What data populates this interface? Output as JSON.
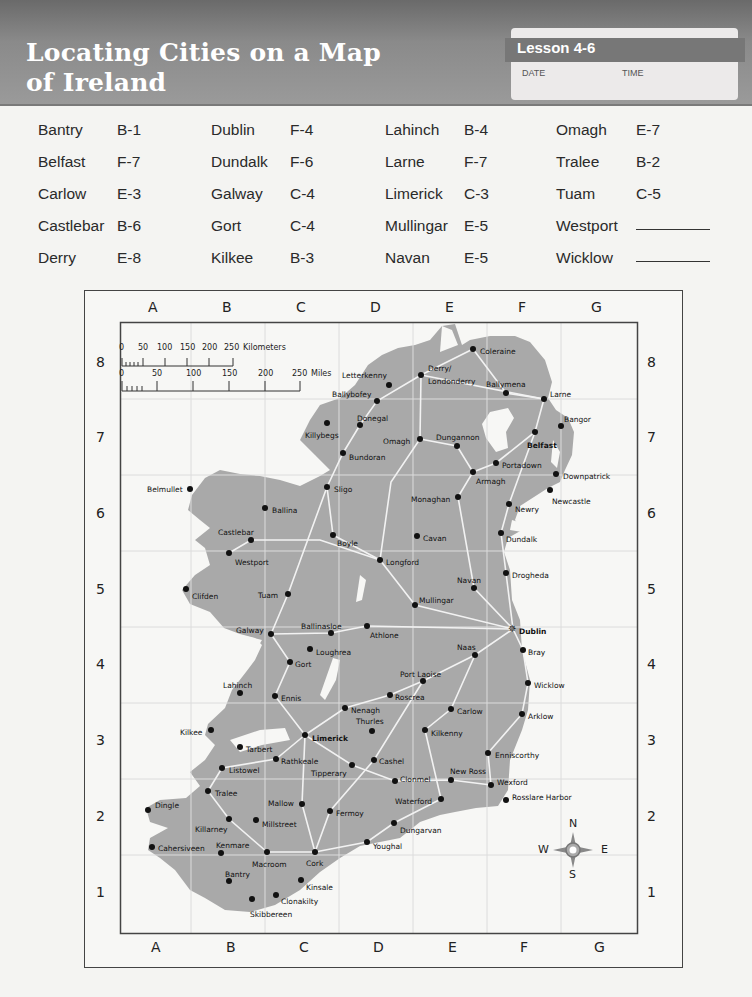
{
  "header": {
    "title_line1": "Locating Cities on a Map",
    "title_line2": "of Ireland",
    "lesson": "Lesson 4-6",
    "date_label": "DATE",
    "time_label": "TIME"
  },
  "city_list": [
    {
      "city": "Bantry",
      "grid": "B-1"
    },
    {
      "city": "Belfast",
      "grid": "F-7"
    },
    {
      "city": "Carlow",
      "grid": "E-3"
    },
    {
      "city": "Castlebar",
      "grid": "B-6"
    },
    {
      "city": "Derry",
      "grid": "E-8"
    },
    {
      "city": "Dublin",
      "grid": "F-4"
    },
    {
      "city": "Dundalk",
      "grid": "F-6"
    },
    {
      "city": "Galway",
      "grid": "C-4"
    },
    {
      "city": "Gort",
      "grid": "C-4"
    },
    {
      "city": "Kilkee",
      "grid": "B-3"
    },
    {
      "city": "Lahinch",
      "grid": "B-4"
    },
    {
      "city": "Larne",
      "grid": "F-7"
    },
    {
      "city": "Limerick",
      "grid": "C-3"
    },
    {
      "city": "Mullingar",
      "grid": "E-5"
    },
    {
      "city": "Navan",
      "grid": "E-5"
    },
    {
      "city": "Omagh",
      "grid": "E-7"
    },
    {
      "city": "Tralee",
      "grid": "B-2"
    },
    {
      "city": "Tuam",
      "grid": "C-5"
    },
    {
      "city": "Westport",
      "grid": ""
    },
    {
      "city": "Wicklow",
      "grid": ""
    }
  ],
  "map": {
    "columns": [
      "A",
      "B",
      "C",
      "D",
      "E",
      "F",
      "G"
    ],
    "rows": [
      "8",
      "7",
      "6",
      "5",
      "4",
      "3",
      "2",
      "1"
    ],
    "scale": {
      "km_ticks": [
        "0",
        "50",
        "100",
        "150",
        "200",
        "250"
      ],
      "km_unit": "Kilometers",
      "mi_ticks": [
        "0",
        "50",
        "100",
        "150",
        "200",
        "250"
      ],
      "mi_unit": "Miles"
    },
    "compass": {
      "n": "N",
      "s": "S",
      "e": "E",
      "w": "W"
    },
    "colors": {
      "land": "#a9a9a9",
      "roads": "#f2f2f2",
      "water": "#f7f7f5",
      "dot": "#111111"
    }
  },
  "cities": [
    {
      "name": "Coleraine",
      "x": 473,
      "y": 349,
      "lx": 480,
      "ly": 353
    },
    {
      "name": "Derry/",
      "x": 421,
      "y": 375,
      "lx": 428,
      "ly": 370
    },
    {
      "name": "Londonderry",
      "x": 421,
      "y": 375,
      "lx": 428,
      "ly": 383
    },
    {
      "name": "Letterkenny",
      "x": 389,
      "y": 385,
      "lx": 342,
      "ly": 377
    },
    {
      "name": "Ballymena",
      "x": 506,
      "y": 393,
      "lx": 486,
      "ly": 386
    },
    {
      "name": "Larne",
      "x": 544,
      "y": 399,
      "lx": 550,
      "ly": 396
    },
    {
      "name": "Ballybofey",
      "x": 377,
      "y": 401,
      "lx": 332,
      "ly": 396
    },
    {
      "name": "Donegal",
      "x": 360,
      "y": 425,
      "lx": 357,
      "ly": 420
    },
    {
      "name": "Killybegs",
      "x": 327,
      "y": 423,
      "lx": 305,
      "ly": 437
    },
    {
      "name": "Bangor",
      "x": 561,
      "y": 426,
      "lx": 564,
      "ly": 421
    },
    {
      "name": "Omagh",
      "x": 420,
      "y": 439,
      "lx": 383,
      "ly": 443
    },
    {
      "name": "Dungannon",
      "x": 457,
      "y": 446,
      "lx": 436,
      "ly": 439
    },
    {
      "name": "Belfast",
      "x": 535,
      "y": 432,
      "lx": 527,
      "ly": 447
    },
    {
      "name": "Bundoran",
      "x": 343,
      "y": 453,
      "lx": 349,
      "ly": 459
    },
    {
      "name": "Portadown",
      "x": 496,
      "y": 463,
      "lx": 502,
      "ly": 467
    },
    {
      "name": "Armagh",
      "x": 473,
      "y": 472,
      "lx": 476,
      "ly": 483
    },
    {
      "name": "Downpatrick",
      "x": 556,
      "y": 474,
      "lx": 563,
      "ly": 478
    },
    {
      "name": "Sligo",
      "x": 327,
      "y": 487,
      "lx": 334,
      "ly": 491
    },
    {
      "name": "Belmullet",
      "x": 190,
      "y": 489,
      "lx": 147,
      "ly": 491
    },
    {
      "name": "Newcastle",
      "x": 550,
      "y": 490,
      "lx": 552,
      "ly": 503
    },
    {
      "name": "Monaghan",
      "x": 458,
      "y": 497,
      "lx": 411,
      "ly": 501
    },
    {
      "name": "Newry",
      "x": 509,
      "y": 504,
      "lx": 515,
      "ly": 511
    },
    {
      "name": "Ballina",
      "x": 265,
      "y": 508,
      "lx": 272,
      "ly": 512
    },
    {
      "name": "Castlebar",
      "x": 251,
      "y": 540,
      "lx": 218,
      "ly": 534
    },
    {
      "name": "Boyle",
      "x": 333,
      "y": 535,
      "lx": 337,
      "ly": 545
    },
    {
      "name": "Cavan",
      "x": 417,
      "y": 536,
      "lx": 423,
      "ly": 540
    },
    {
      "name": "Dundalk",
      "x": 501,
      "y": 533,
      "lx": 506,
      "ly": 541
    },
    {
      "name": "Westport",
      "x": 229,
      "y": 553,
      "lx": 235,
      "ly": 564
    },
    {
      "name": "Longford",
      "x": 380,
      "y": 560,
      "lx": 386,
      "ly": 564
    },
    {
      "name": "Drogheda",
      "x": 506,
      "y": 573,
      "lx": 512,
      "ly": 577
    },
    {
      "name": "Clifden",
      "x": 186,
      "y": 589,
      "lx": 192,
      "ly": 598
    },
    {
      "name": "Tuam",
      "x": 288,
      "y": 594,
      "lx": 258,
      "ly": 597
    },
    {
      "name": "Navan",
      "x": 474,
      "y": 588,
      "lx": 457,
      "ly": 582
    },
    {
      "name": "Mullingar",
      "x": 415,
      "y": 605,
      "lx": 419,
      "ly": 602
    },
    {
      "name": "Ballinasloe",
      "x": 331,
      "y": 633,
      "lx": 301,
      "ly": 628
    },
    {
      "name": "Galway",
      "x": 271,
      "y": 634,
      "lx": 236,
      "ly": 632
    },
    {
      "name": "Athlone",
      "x": 367,
      "y": 626,
      "lx": 370,
      "ly": 637
    },
    {
      "name": "Loughrea",
      "x": 310,
      "y": 649,
      "lx": 316,
      "ly": 654
    },
    {
      "name": "Gort",
      "x": 290,
      "y": 662,
      "lx": 295,
      "ly": 666
    },
    {
      "name": "Naas",
      "x": 475,
      "y": 655,
      "lx": 457,
      "ly": 649
    },
    {
      "name": "Bray",
      "x": 523,
      "y": 650,
      "lx": 528,
      "ly": 654
    },
    {
      "name": "Port Laoise",
      "x": 423,
      "y": 681,
      "lx": 400,
      "ly": 676
    },
    {
      "name": "Lahinch",
      "x": 240,
      "y": 693,
      "lx": 223,
      "ly": 687
    },
    {
      "name": "Ennis",
      "x": 275,
      "y": 696,
      "lx": 281,
      "ly": 700
    },
    {
      "name": "Roscrea",
      "x": 390,
      "y": 695,
      "lx": 395,
      "ly": 699
    },
    {
      "name": "Wicklow",
      "x": 528,
      "y": 683,
      "lx": 534,
      "ly": 687
    },
    {
      "name": "Nenagh",
      "x": 345,
      "y": 708,
      "lx": 351,
      "ly": 712
    },
    {
      "name": "Carlow",
      "x": 451,
      "y": 709,
      "lx": 457,
      "ly": 713
    },
    {
      "name": "Thurles",
      "x": 372,
      "y": 731,
      "lx": 356,
      "ly": 723
    },
    {
      "name": "Kilkee",
      "x": 211,
      "y": 730,
      "lx": 180,
      "ly": 734
    },
    {
      "name": "Limerick",
      "x": 305,
      "y": 735,
      "lx": 312,
      "ly": 740
    },
    {
      "name": "Kilkenny",
      "x": 425,
      "y": 730,
      "lx": 431,
      "ly": 735
    },
    {
      "name": "Arklow",
      "x": 522,
      "y": 714,
      "lx": 528,
      "ly": 718
    },
    {
      "name": "Tarbert",
      "x": 240,
      "y": 747,
      "lx": 246,
      "ly": 751
    },
    {
      "name": "Rathkeale",
      "x": 276,
      "y": 759,
      "lx": 281,
      "ly": 763
    },
    {
      "name": "Cashel",
      "x": 374,
      "y": 760,
      "lx": 379,
      "ly": 763
    },
    {
      "name": "Tipperary",
      "x": 352,
      "y": 765,
      "lx": 311,
      "ly": 775
    },
    {
      "name": "Enniscorthy",
      "x": 488,
      "y": 753,
      "lx": 495,
      "ly": 757
    },
    {
      "name": "Listowel",
      "x": 222,
      "y": 768,
      "lx": 229,
      "ly": 772
    },
    {
      "name": "Clonmel",
      "x": 395,
      "y": 781,
      "lx": 400,
      "ly": 781
    },
    {
      "name": "New Ross",
      "x": 451,
      "y": 780,
      "lx": 450,
      "ly": 773
    },
    {
      "name": "Wexford",
      "x": 491,
      "y": 785,
      "lx": 497,
      "ly": 784
    },
    {
      "name": "Tralee",
      "x": 208,
      "y": 791,
      "lx": 215,
      "ly": 795
    },
    {
      "name": "Waterford",
      "x": 441,
      "y": 799,
      "lx": 395,
      "ly": 803
    },
    {
      "name": "Rosslare Harbor",
      "x": 506,
      "y": 800,
      "lx": 512,
      "ly": 799
    },
    {
      "name": "Dingle",
      "x": 148,
      "y": 810,
      "lx": 155,
      "ly": 807
    },
    {
      "name": "Mallow",
      "x": 302,
      "y": 804,
      "lx": 268,
      "ly": 805
    },
    {
      "name": "Fermoy",
      "x": 330,
      "y": 811,
      "lx": 336,
      "ly": 815
    },
    {
      "name": "Millstreet",
      "x": 256,
      "y": 820,
      "lx": 262,
      "ly": 826
    },
    {
      "name": "Killarney",
      "x": 229,
      "y": 819,
      "lx": 195,
      "ly": 831
    },
    {
      "name": "Dungarvan",
      "x": 394,
      "y": 823,
      "lx": 400,
      "ly": 832
    },
    {
      "name": "Youghal",
      "x": 367,
      "y": 842,
      "lx": 373,
      "ly": 848
    },
    {
      "name": "Cahersiveen",
      "x": 152,
      "y": 847,
      "lx": 158,
      "ly": 850
    },
    {
      "name": "Kenmare",
      "x": 221,
      "y": 853,
      "lx": 216,
      "ly": 847
    },
    {
      "name": "Macroom",
      "x": 267,
      "y": 852,
      "lx": 252,
      "ly": 866
    },
    {
      "name": "Cork",
      "x": 315,
      "y": 852,
      "lx": 306,
      "ly": 865
    },
    {
      "name": "Bantry",
      "x": 229,
      "y": 881,
      "lx": 225,
      "ly": 876
    },
    {
      "name": "Kinsale",
      "x": 301,
      "y": 880,
      "lx": 306,
      "ly": 889
    },
    {
      "name": "Clonakilty",
      "x": 276,
      "y": 895,
      "lx": 281,
      "ly": 903
    },
    {
      "name": "Skibbereen",
      "x": 252,
      "y": 899,
      "lx": 250,
      "ly": 916
    }
  ],
  "dublin": {
    "name": "Dublin",
    "x": 513,
    "y": 629,
    "lx": 519,
    "ly": 633
  }
}
